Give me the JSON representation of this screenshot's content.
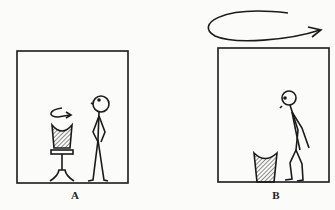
{
  "figure": {
    "panels": [
      {
        "id": "A",
        "label": "A",
        "description": "Stick figure standing upright beside a swivel stool; small rotation arrow above stool"
      },
      {
        "id": "B",
        "label": "B",
        "description": "Stick figure stooped forward beside a bucket; large rotation arrow above the frame"
      }
    ],
    "colors": {
      "ink": "#1a1a1a",
      "paper": "#fbfbf9"
    }
  }
}
